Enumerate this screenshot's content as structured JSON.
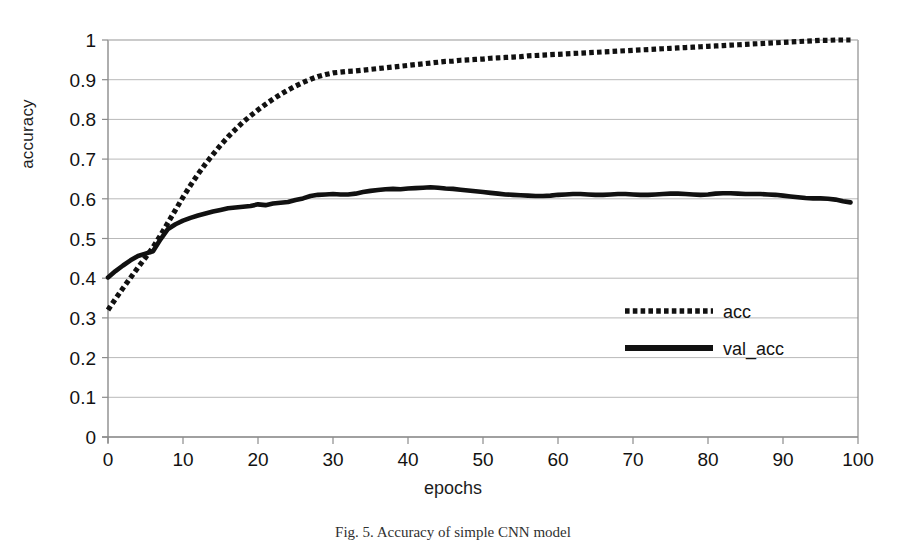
{
  "figure": {
    "caption": "Fig. 5. Accuracy of simple CNN model",
    "background_color": "#ffffff",
    "ink_color": "#111111",
    "grid_color": "#b9b9b9"
  },
  "chart_data": {
    "type": "line",
    "title": "",
    "subtitle": "",
    "xlabel": "epochs",
    "ylabel": "accuracy",
    "xlim": [
      0,
      100
    ],
    "ylim": [
      0,
      1
    ],
    "grid": true,
    "grid_axis": "y",
    "legend_position": "inside-right",
    "x_ticks": [
      0,
      10,
      20,
      30,
      40,
      50,
      60,
      70,
      80,
      90,
      100
    ],
    "x_tick_labels": [
      "0",
      "10",
      "20",
      "30",
      "40",
      "50",
      "60",
      "70",
      "80",
      "90",
      "100"
    ],
    "y_ticks": [
      0,
      0.1,
      0.2,
      0.3,
      0.4,
      0.5,
      0.6,
      0.7,
      0.8,
      0.9,
      1
    ],
    "y_tick_labels": [
      "0",
      "0.1",
      "0.2",
      "0.3",
      "0.4",
      "0.5",
      "0.6",
      "0.7",
      "0.8",
      "0.9",
      "1"
    ],
    "x": [
      0,
      1,
      2,
      3,
      4,
      5,
      6,
      7,
      8,
      9,
      10,
      11,
      12,
      13,
      14,
      15,
      16,
      17,
      18,
      19,
      20,
      21,
      22,
      23,
      24,
      25,
      26,
      27,
      28,
      29,
      30,
      31,
      32,
      33,
      34,
      35,
      36,
      37,
      38,
      39,
      40,
      41,
      42,
      43,
      44,
      45,
      46,
      47,
      48,
      49,
      50,
      51,
      52,
      53,
      54,
      55,
      56,
      57,
      58,
      59,
      60,
      61,
      62,
      63,
      64,
      65,
      66,
      67,
      68,
      69,
      70,
      71,
      72,
      73,
      74,
      75,
      76,
      77,
      78,
      79,
      80,
      81,
      82,
      83,
      84,
      85,
      86,
      87,
      88,
      89,
      90,
      91,
      92,
      93,
      94,
      95,
      96,
      97,
      98,
      99
    ],
    "series": [
      {
        "name": "acc",
        "style": "dotted",
        "color": "#111111",
        "values": [
          0.32,
          0.348,
          0.375,
          0.401,
          0.427,
          0.452,
          0.478,
          0.508,
          0.54,
          0.572,
          0.604,
          0.634,
          0.662,
          0.688,
          0.712,
          0.735,
          0.756,
          0.775,
          0.793,
          0.809,
          0.824,
          0.838,
          0.851,
          0.863,
          0.874,
          0.884,
          0.893,
          0.901,
          0.908,
          0.913,
          0.917,
          0.919,
          0.921,
          0.922,
          0.924,
          0.926,
          0.928,
          0.93,
          0.932,
          0.934,
          0.936,
          0.938,
          0.94,
          0.942,
          0.944,
          0.946,
          0.947,
          0.949,
          0.95,
          0.951,
          0.952,
          0.954,
          0.955,
          0.956,
          0.957,
          0.958,
          0.96,
          0.961,
          0.962,
          0.963,
          0.964,
          0.965,
          0.966,
          0.967,
          0.968,
          0.969,
          0.97,
          0.971,
          0.972,
          0.973,
          0.974,
          0.975,
          0.976,
          0.977,
          0.978,
          0.979,
          0.98,
          0.981,
          0.982,
          0.983,
          0.984,
          0.985,
          0.986,
          0.987,
          0.988,
          0.989,
          0.99,
          0.991,
          0.992,
          0.993,
          0.994,
          0.995,
          0.996,
          0.997,
          0.998,
          0.999,
          0.999,
          1.0,
          1.0,
          1.0
        ]
      },
      {
        "name": "val_acc",
        "style": "solid",
        "color": "#111111",
        "values": [
          0.402,
          0.418,
          0.432,
          0.445,
          0.456,
          0.462,
          0.468,
          0.498,
          0.524,
          0.536,
          0.545,
          0.552,
          0.558,
          0.563,
          0.568,
          0.572,
          0.576,
          0.578,
          0.58,
          0.582,
          0.586,
          0.584,
          0.588,
          0.59,
          0.592,
          0.597,
          0.601,
          0.607,
          0.61,
          0.611,
          0.612,
          0.611,
          0.611,
          0.613,
          0.617,
          0.62,
          0.622,
          0.624,
          0.625,
          0.624,
          0.626,
          0.627,
          0.628,
          0.629,
          0.628,
          0.626,
          0.625,
          0.623,
          0.621,
          0.619,
          0.617,
          0.615,
          0.613,
          0.611,
          0.61,
          0.609,
          0.608,
          0.607,
          0.607,
          0.608,
          0.61,
          0.611,
          0.612,
          0.612,
          0.611,
          0.61,
          0.61,
          0.611,
          0.612,
          0.612,
          0.611,
          0.61,
          0.61,
          0.611,
          0.612,
          0.613,
          0.613,
          0.612,
          0.611,
          0.61,
          0.611,
          0.613,
          0.614,
          0.614,
          0.613,
          0.612,
          0.612,
          0.612,
          0.611,
          0.61,
          0.608,
          0.606,
          0.604,
          0.602,
          0.601,
          0.601,
          0.6,
          0.598,
          0.594,
          0.591
        ]
      }
    ],
    "legend": [
      {
        "label": "acc",
        "style": "dotted"
      },
      {
        "label": "val_acc",
        "style": "solid"
      }
    ]
  }
}
